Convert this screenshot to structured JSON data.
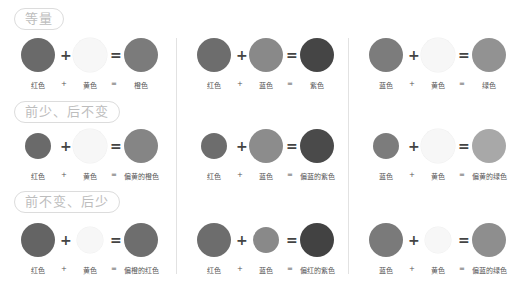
{
  "sections": [
    {
      "title": "等量",
      "top": 8
    },
    {
      "title": "前少、后不变",
      "top": 101
    },
    {
      "title": "前不变、后少",
      "top": 191
    }
  ],
  "colors": {
    "red": "#6a6a6a",
    "yellow": "#f7f7f7",
    "blue": "#8c8c8c",
    "orange": "#7a7a7a",
    "purple": "#404040",
    "green": "#989898",
    "light_green": "#aaaaaa"
  },
  "rows": [
    {
      "y": 55,
      "label_y": 80,
      "cells": [
        {
          "a": {
            "label": "红色",
            "color": "#6a6a6a",
            "r": 17
          },
          "b": {
            "label": "黄色",
            "color": "#f7f7f7",
            "r": 17
          },
          "c": {
            "label": "橙色",
            "color": "#7b7b7b",
            "r": 17
          }
        },
        {
          "a": {
            "label": "红色",
            "color": "#6d6d6d",
            "r": 17
          },
          "b": {
            "label": "蓝色",
            "color": "#898989",
            "r": 17
          },
          "c": {
            "label": "紫色",
            "color": "#454545",
            "r": 17
          }
        },
        {
          "a": {
            "label": "蓝色",
            "color": "#7c7c7c",
            "r": 17
          },
          "b": {
            "label": "黄色",
            "color": "#f7f7f7",
            "r": 17
          },
          "c": {
            "label": "绿色",
            "color": "#929292",
            "r": 17
          }
        }
      ]
    },
    {
      "y": 146,
      "label_y": 171,
      "cells": [
        {
          "a": {
            "label": "红色",
            "color": "#6a6a6a",
            "r": 13
          },
          "b": {
            "label": "黄色",
            "color": "#f7f7f7",
            "r": 17
          },
          "c": {
            "label": "偏黄的橙色",
            "color": "#858585",
            "r": 17
          }
        },
        {
          "a": {
            "label": "红色",
            "color": "#6d6d6d",
            "r": 13
          },
          "b": {
            "label": "蓝色",
            "color": "#8c8c8c",
            "r": 17
          },
          "c": {
            "label": "偏蓝的紫色",
            "color": "#4a4a4a",
            "r": 17
          }
        },
        {
          "a": {
            "label": "蓝色",
            "color": "#7c7c7c",
            "r": 13
          },
          "b": {
            "label": "黄色",
            "color": "#f7f7f7",
            "r": 17
          },
          "c": {
            "label": "偏黄的绿色",
            "color": "#a8a8a8",
            "r": 17
          }
        }
      ]
    },
    {
      "y": 240,
      "label_y": 265,
      "cells": [
        {
          "a": {
            "label": "红色",
            "color": "#646464",
            "r": 17
          },
          "b": {
            "label": "黄色",
            "color": "#f7f7f7",
            "r": 13
          },
          "c": {
            "label": "偏橙的红色",
            "color": "#6e6e6e",
            "r": 17
          }
        },
        {
          "a": {
            "label": "红色",
            "color": "#6d6d6d",
            "r": 17
          },
          "b": {
            "label": "蓝色",
            "color": "#898989",
            "r": 13
          },
          "c": {
            "label": "偏红的紫色",
            "color": "#424242",
            "r": 17
          }
        },
        {
          "a": {
            "label": "蓝色",
            "color": "#7a7a7a",
            "r": 17
          },
          "b": {
            "label": "黄色",
            "color": "#f7f7f7",
            "r": 13
          },
          "c": {
            "label": "偏蓝的绿色",
            "color": "#8e8e8e",
            "r": 17
          }
        }
      ]
    }
  ],
  "operators": {
    "plus": "+",
    "equals": "="
  }
}
